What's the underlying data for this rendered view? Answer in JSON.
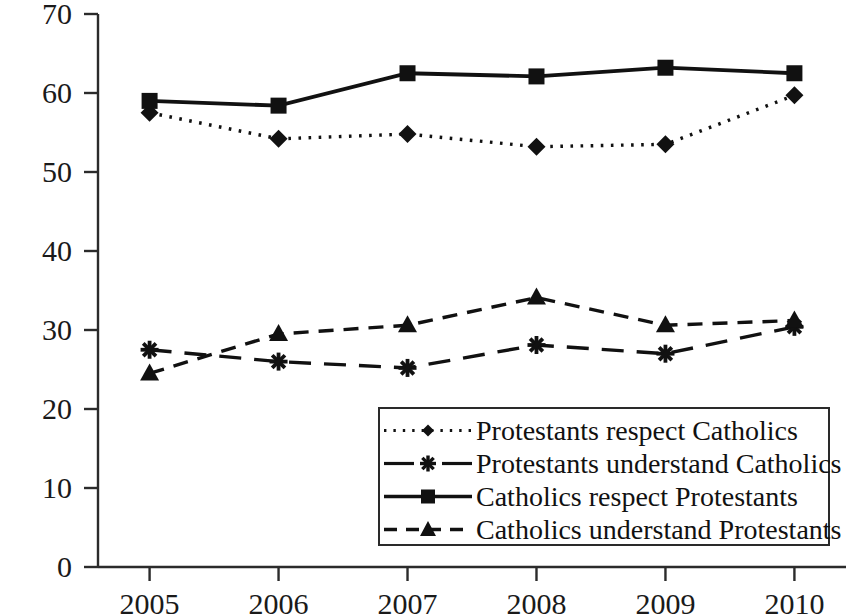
{
  "chart_data": {
    "type": "line",
    "title": "",
    "subtitle": "",
    "xlabel": "",
    "ylabel": "Per cent",
    "categories": [
      "2005",
      "2006",
      "2007",
      "2008",
      "2009",
      "2010"
    ],
    "x": [
      2005,
      2006,
      2007,
      2008,
      2009,
      2010
    ],
    "xlim": [
      2004.6,
      2010.4
    ],
    "ylim": [
      0,
      70
    ],
    "yticks": [
      0,
      10,
      20,
      30,
      40,
      50,
      60,
      70
    ],
    "ytick_labels": [
      "0",
      "10",
      "20",
      "30",
      "40",
      "50",
      "60",
      "70"
    ],
    "grid": false,
    "legend_position": "lower right",
    "series": [
      {
        "name": "Protestants respect Catholics",
        "values": [
          57.5,
          54.2,
          54.8,
          53.2,
          53.5,
          59.7
        ],
        "marker": "diamond",
        "line_style": "dotted",
        "color": "#111111"
      },
      {
        "name": "Protestants understand Catholics",
        "values": [
          27.5,
          26.0,
          25.2,
          28.1,
          27.0,
          30.4
        ],
        "marker": "star",
        "line_style": "long-dashed",
        "color": "#111111"
      },
      {
        "name": "Catholics respect Protestants",
        "values": [
          59.0,
          58.4,
          62.5,
          62.1,
          63.2,
          62.5
        ],
        "marker": "square",
        "line_style": "solid",
        "color": "#111111"
      },
      {
        "name": "Catholics understand Protestants",
        "values": [
          24.5,
          29.5,
          30.6,
          34.1,
          30.6,
          31.2
        ],
        "marker": "triangle",
        "line_style": "dashed",
        "color": "#111111"
      }
    ]
  },
  "axis": {
    "y_title": "Per cent"
  },
  "legend": {
    "items": [
      {
        "label": "Protestants respect Catholics"
      },
      {
        "label": "Protestants understand Catholics"
      },
      {
        "label": "Catholics respect Protestants"
      },
      {
        "label": "Catholics understand Protestants"
      }
    ]
  }
}
